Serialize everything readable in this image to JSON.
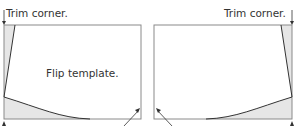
{
  "diagram": {
    "left_panel": {
      "top_label": "Trim corner.",
      "center_label": "Flip template."
    },
    "right_panel": {
      "top_label": "Trim corner."
    },
    "colors": {
      "stroke": "#333333",
      "border": "#888888",
      "fill": "#e6e6e6"
    }
  }
}
